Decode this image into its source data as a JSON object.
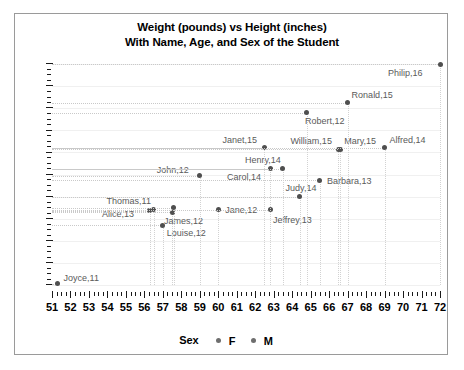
{
  "chart_data": {
    "type": "scatter",
    "title": "Weight (pounds) vs Height (inches)",
    "subtitle": "With Name, Age, and Sex of the Student",
    "xlabel": "",
    "ylabel": "",
    "xlim": [
      51,
      72
    ],
    "ylim": [
      50,
      150
    ],
    "xticks": [
      51,
      52,
      53,
      54,
      55,
      56,
      57,
      58,
      59,
      60,
      61,
      62,
      63,
      64,
      65,
      66,
      67,
      68,
      69,
      70,
      71,
      72
    ],
    "yticks": [
      50,
      60,
      70,
      80,
      90,
      100,
      110,
      120,
      130,
      140,
      150
    ],
    "y_minor_step": 2.5,
    "x_minor_step": 0.25,
    "grid": "dotted-leader-lines",
    "legend": {
      "position": "bottom",
      "title": "Sex",
      "entries": [
        {
          "label": "F",
          "color": "#6e6e6e"
        },
        {
          "label": "M",
          "color": "#6e6e6e"
        }
      ]
    },
    "marker_color": "#4f4f4f",
    "points": [
      {
        "name": "Joyce",
        "age": 11,
        "sex": "F",
        "x": 51.3,
        "y": 50.5,
        "label": "Joyce,11",
        "lx": 6,
        "ly": -11
      },
      {
        "name": "Louise",
        "age": 12,
        "sex": "F",
        "x": 57.0,
        "y": 77.0,
        "label": "Louise,12",
        "lx": 4,
        "ly": 3
      },
      {
        "name": "Alice",
        "age": 13,
        "sex": "F",
        "x": 56.3,
        "y": 83.5,
        "label": "Alice,13",
        "lx": -48,
        "ly": -2
      },
      {
        "name": "Thomas",
        "age": 11,
        "sex": "M",
        "x": 56.5,
        "y": 84.0,
        "label": "Thomas,11",
        "lx": -47,
        "ly": -14
      },
      {
        "name": "James",
        "age": 12,
        "sex": "M",
        "x": 57.5,
        "y": 83.0,
        "label": "James,12",
        "lx": -8,
        "ly": 4
      },
      {
        "name": "James2",
        "age": 12,
        "sex": "M",
        "x": 57.6,
        "y": 85.0,
        "label": "",
        "lx": 0,
        "ly": 0
      },
      {
        "name": "Jane",
        "age": 12,
        "sex": "F",
        "x": 60.0,
        "y": 84.0,
        "label": "Jane,12",
        "lx": 7,
        "ly": -5
      },
      {
        "name": "Jeffrey",
        "age": 13,
        "sex": "M",
        "x": 62.8,
        "y": 84.0,
        "label": "Jeffrey,13",
        "lx": 3,
        "ly": 5
      },
      {
        "name": "Judy",
        "age": 14,
        "sex": "F",
        "x": 64.4,
        "y": 90.0,
        "label": "Judy,14",
        "lx": -14,
        "ly": -14
      },
      {
        "name": "Barbara",
        "age": 13,
        "sex": "F",
        "x": 65.5,
        "y": 97.5,
        "label": "Barbara,13",
        "lx": 7,
        "ly": -4
      },
      {
        "name": "John",
        "age": 12,
        "sex": "M",
        "x": 59.0,
        "y": 99.5,
        "label": "John,12",
        "lx": -43,
        "ly": -11
      },
      {
        "name": "Carol",
        "age": 14,
        "sex": "F",
        "x": 62.8,
        "y": 102.5,
        "label": "Carol,14",
        "lx": -43,
        "ly": 3
      },
      {
        "name": "Henry",
        "age": 14,
        "sex": "M",
        "x": 63.5,
        "y": 102.5,
        "label": "Henry,14",
        "lx": -38,
        "ly": -14
      },
      {
        "name": "Janet",
        "age": 15,
        "sex": "F",
        "x": 62.5,
        "y": 112.0,
        "label": "Janet,15",
        "lx": -42,
        "ly": -13
      },
      {
        "name": "William",
        "age": 15,
        "sex": "M",
        "x": 66.5,
        "y": 111.5,
        "label": "William,15",
        "lx": -48,
        "ly": -13
      },
      {
        "name": "Mary",
        "age": 15,
        "sex": "F",
        "x": 66.6,
        "y": 111.5,
        "label": "Mary,15",
        "lx": 4,
        "ly": -13
      },
      {
        "name": "Alfred",
        "age": 14,
        "sex": "M",
        "x": 69.0,
        "y": 112.0,
        "label": "Alfred,14",
        "lx": 5,
        "ly": -13
      },
      {
        "name": "Robert",
        "age": 12,
        "sex": "M",
        "x": 64.8,
        "y": 128.0,
        "label": "Robert,12",
        "lx": -2,
        "ly": 3
      },
      {
        "name": "Ronald",
        "age": 15,
        "sex": "M",
        "x": 67.0,
        "y": 132.5,
        "label": "Ronald,15",
        "lx": 4,
        "ly": -13
      },
      {
        "name": "Philip",
        "age": 16,
        "sex": "M",
        "x": 72.0,
        "y": 150.0,
        "label": "Philip,16",
        "lx": -52,
        "ly": 4
      }
    ]
  }
}
